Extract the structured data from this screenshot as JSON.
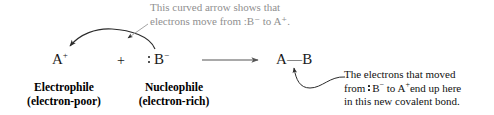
{
  "diagram": {
    "top_annotation": {
      "line1": "This curved arrow shows that",
      "line2": "electrons move from :B⁻ to A⁺.",
      "color": "#8f8f8f"
    },
    "reaction": {
      "reactant_a": "A",
      "reactant_a_charge": "+",
      "plus": "+",
      "reactant_b": "B",
      "reactant_b_charge": "−",
      "reaction_arrow": "⟶",
      "product": "A—B",
      "product_left_atom": "A",
      "product_bond": "—",
      "product_right_atom": "B"
    },
    "labels": {
      "electrophile_line1": "Electrophile",
      "electrophile_line2": "(electron-poor)",
      "nucleophile_line1": "Nucleophile",
      "nucleophile_line2": "(electron-rich)"
    },
    "right_annotation": {
      "line1": "The electrons that moved",
      "line2_pre": "from ",
      "line2_b": "B",
      "line2_b_charge": "−",
      "line2_mid": " to A",
      "line2_a_charge": "+",
      "line2_post": "end up here",
      "line3": "in this new covalent bond.",
      "color": "#111111"
    },
    "colors": {
      "ink": "#1a1a1a",
      "annotation_gray": "#8f8f8f",
      "background": "#ffffff"
    }
  }
}
